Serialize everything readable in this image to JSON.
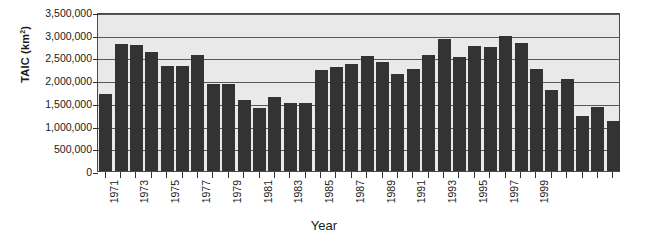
{
  "chart_data": {
    "type": "bar",
    "title": "",
    "xlabel": "Year",
    "ylabel": "TAIC (km2)",
    "ylabel_text": "TAIC (km",
    "ylabel_sup": "2",
    "ylabel_close": ")",
    "ylim": [
      0,
      3500000
    ],
    "ytick_step": 500000,
    "ytick_labels": [
      "3,500,000",
      "3,000,000",
      "2,500,000",
      "2,000,000",
      "1,500,000",
      "1,000,000",
      "500,000",
      "0"
    ],
    "ytick_values": [
      3500000,
      3000000,
      2500000,
      2000000,
      1500000,
      1000000,
      500000,
      0
    ],
    "grid": true,
    "legend": "none",
    "bar_color": "#333333",
    "plot_background": "#e9e9e9",
    "axis_color": "#4a4a4a",
    "categories": [
      1971,
      1972,
      1973,
      1974,
      1975,
      1976,
      1977,
      1978,
      1979,
      1980,
      1981,
      1982,
      1983,
      1984,
      1985,
      1986,
      1987,
      1988,
      1989,
      1990,
      1991,
      1992,
      1993,
      1994,
      1995,
      1996,
      1997,
      1998,
      1999,
      2000
    ],
    "xtick_labels_visible": [
      "1971",
      "1973",
      "1975",
      "1977",
      "1979",
      "1981",
      "1983",
      "1985",
      "1987",
      "1989",
      "1991",
      "1993",
      "1995",
      "1997",
      "1999"
    ],
    "values": [
      1700000,
      2800000,
      2780000,
      2620000,
      2320000,
      2320000,
      2550000,
      1920000,
      1920000,
      1560000,
      1380000,
      1620000,
      1500000,
      1500000,
      2220000,
      2280000,
      2350000,
      2530000,
      2400000,
      2130000,
      2250000,
      2550000,
      2900000,
      2520000,
      2750000,
      2720000,
      2970000,
      2820000,
      2250000,
      1780000
    ],
    "bars": [
      {
        "year": "1971",
        "value": 1700000
      },
      {
        "year": "1972",
        "value": 2800000
      },
      {
        "year": "1973",
        "value": 2780000
      },
      {
        "year": "1974",
        "value": 2620000
      },
      {
        "year": "1975",
        "value": 2320000
      },
      {
        "year": "1976",
        "value": 2320000
      },
      {
        "year": "1977",
        "value": 2550000
      },
      {
        "year": "1978",
        "value": 1920000
      },
      {
        "year": "1979",
        "value": 1920000
      },
      {
        "year": "1980",
        "value": 1560000
      },
      {
        "year": "1981",
        "value": 1380000
      },
      {
        "year": "1982",
        "value": 1620000
      },
      {
        "year": "1983",
        "value": 1500000
      },
      {
        "year": "1984",
        "value": 1500000
      },
      {
        "year": "1985",
        "value": 2220000
      },
      {
        "year": "1986",
        "value": 2280000
      },
      {
        "year": "1987",
        "value": 2350000
      },
      {
        "year": "1988",
        "value": 2530000
      },
      {
        "year": "1989",
        "value": 2400000
      },
      {
        "year": "1990",
        "value": 2130000
      },
      {
        "year": "1991",
        "value": 2250000
      },
      {
        "year": "1992",
        "value": 2550000
      },
      {
        "year": "1993",
        "value": 2900000
      },
      {
        "year": "1994",
        "value": 2520000
      },
      {
        "year": "1995",
        "value": 2750000
      },
      {
        "year": "1996",
        "value": 2720000
      },
      {
        "year": "1997",
        "value": 2970000
      },
      {
        "year": "1998",
        "value": 2820000
      },
      {
        "year": "1999",
        "value": 2250000
      },
      {
        "year": "2000",
        "value": 1780000
      },
      {
        "year": "2001",
        "value": 2020000
      },
      {
        "year": "2002",
        "value": 1220000
      },
      {
        "year": "2003",
        "value": 1420000
      },
      {
        "year": "2004",
        "value": 1100000
      }
    ]
  }
}
